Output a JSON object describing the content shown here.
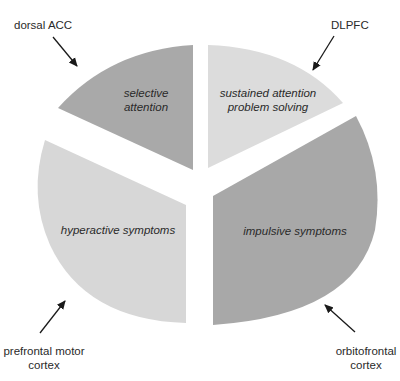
{
  "diagram": {
    "type": "exploded-pie",
    "slices": [
      {
        "id": "top-left",
        "label_lines": [
          "selective",
          "attention"
        ],
        "color": "#a9a9a9"
      },
      {
        "id": "top-right",
        "label_lines": [
          "sustained attention",
          "problem solving"
        ],
        "color": "#dcdcdc"
      },
      {
        "id": "bottom-left",
        "label_lines": [
          "hyperactive symptoms"
        ],
        "color": "#d7d7d7"
      },
      {
        "id": "bottom-right",
        "label_lines": [
          "impulsive symptoms"
        ],
        "color": "#a8a8a8"
      }
    ],
    "regions": [
      {
        "id": "dorsal-acc",
        "label_lines": [
          "dorsal ACC"
        ],
        "points_to": "top-left"
      },
      {
        "id": "dlpfc",
        "label_lines": [
          "DLPFC"
        ],
        "points_to": "top-right"
      },
      {
        "id": "prefrontal-motor-cortex",
        "label_lines": [
          "prefrontal motor",
          "cortex"
        ],
        "points_to": "bottom-left"
      },
      {
        "id": "orbitofrontal-cortex",
        "label_lines": [
          "orbitofrontal",
          "cortex"
        ],
        "points_to": "bottom-right"
      }
    ],
    "arrow_color": "#1a1a1a"
  }
}
